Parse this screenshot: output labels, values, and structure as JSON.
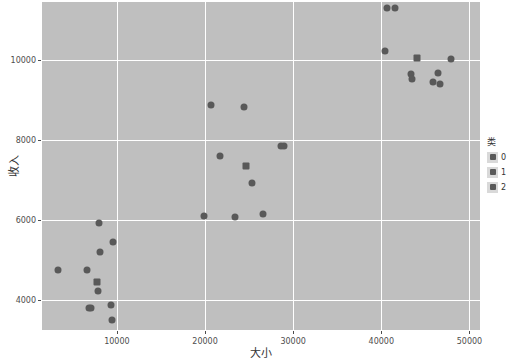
{
  "chart_data": {
    "type": "scatter",
    "title": "",
    "xlabel": "大小",
    "ylabel": "收入",
    "xlim": [
      1500,
      51200
    ],
    "ylim": [
      3250,
      11450
    ],
    "xticks": [
      10000,
      20000,
      30000,
      40000,
      50000
    ],
    "xtick_labels": [
      "10000",
      "20000",
      "30000",
      "40000",
      "50000"
    ],
    "yticks": [
      4000,
      6000,
      8000,
      10000
    ],
    "ytick_labels": [
      "4000",
      "6000",
      "8000",
      "10000"
    ],
    "grid": true,
    "legend": {
      "title": "类",
      "position": "right",
      "entries": [
        {
          "label": "0",
          "marker": "square",
          "color": "#595959"
        },
        {
          "label": "1",
          "marker": "square",
          "color": "#595959"
        },
        {
          "label": "2",
          "marker": "square",
          "color": "#595959"
        }
      ]
    },
    "panel_background": "#bfbfbf",
    "grid_color": "#ffffff",
    "marker_color": "#595959",
    "points": [
      {
        "x": 3300,
        "y": 4760,
        "marker": "circle",
        "cls": "1"
      },
      {
        "x": 6600,
        "y": 4750,
        "marker": "circle",
        "cls": "1"
      },
      {
        "x": 6800,
        "y": 3810,
        "marker": "circle",
        "cls": "1"
      },
      {
        "x": 7100,
        "y": 3790,
        "marker": "circle",
        "cls": "1"
      },
      {
        "x": 7700,
        "y": 4440,
        "marker": "square",
        "cls": "1"
      },
      {
        "x": 7800,
        "y": 4230,
        "marker": "circle",
        "cls": "1"
      },
      {
        "x": 7950,
        "y": 5930,
        "marker": "circle",
        "cls": "1"
      },
      {
        "x": 8100,
        "y": 5200,
        "marker": "circle",
        "cls": "1"
      },
      {
        "x": 9300,
        "y": 3880,
        "marker": "circle",
        "cls": "1"
      },
      {
        "x": 9450,
        "y": 3510,
        "marker": "circle",
        "cls": "1"
      },
      {
        "x": 9600,
        "y": 5460,
        "marker": "circle",
        "cls": "1"
      },
      {
        "x": 19900,
        "y": 6090,
        "marker": "circle",
        "cls": "0"
      },
      {
        "x": 20700,
        "y": 8870,
        "marker": "circle",
        "cls": "0"
      },
      {
        "x": 21700,
        "y": 7600,
        "marker": "circle",
        "cls": "0"
      },
      {
        "x": 23400,
        "y": 6070,
        "marker": "circle",
        "cls": "0"
      },
      {
        "x": 24400,
        "y": 8830,
        "marker": "circle",
        "cls": "0"
      },
      {
        "x": 24700,
        "y": 7340,
        "marker": "square",
        "cls": "0"
      },
      {
        "x": 25300,
        "y": 6930,
        "marker": "circle",
        "cls": "0"
      },
      {
        "x": 26600,
        "y": 6140,
        "marker": "circle",
        "cls": "0"
      },
      {
        "x": 28600,
        "y": 7840,
        "marker": "circle",
        "cls": "0"
      },
      {
        "x": 29000,
        "y": 7850,
        "marker": "circle",
        "cls": "0"
      },
      {
        "x": 40600,
        "y": 11290,
        "marker": "circle",
        "cls": "2"
      },
      {
        "x": 41600,
        "y": 11290,
        "marker": "circle",
        "cls": "2"
      },
      {
        "x": 40400,
        "y": 10230,
        "marker": "circle",
        "cls": "2"
      },
      {
        "x": 43400,
        "y": 9640,
        "marker": "circle",
        "cls": "2"
      },
      {
        "x": 43500,
        "y": 9530,
        "marker": "circle",
        "cls": "2"
      },
      {
        "x": 44100,
        "y": 10050,
        "marker": "square",
        "cls": "2"
      },
      {
        "x": 45900,
        "y": 9440,
        "marker": "circle",
        "cls": "2"
      },
      {
        "x": 46400,
        "y": 9670,
        "marker": "circle",
        "cls": "2"
      },
      {
        "x": 46700,
        "y": 9390,
        "marker": "circle",
        "cls": "2"
      },
      {
        "x": 47900,
        "y": 10020,
        "marker": "circle",
        "cls": "2"
      }
    ]
  }
}
